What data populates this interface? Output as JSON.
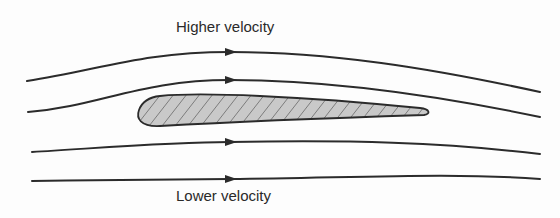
{
  "diagram": {
    "labels": {
      "top": "Higher velocity",
      "bottom": "Lower velocity"
    },
    "colors": {
      "stroke": "#2b2b2b",
      "airfoil_fill": "#c9c9c9",
      "hatch": "#3a3a3a",
      "background": "#fdfdfd"
    },
    "streamlines": [
      {
        "id": "streamline-1",
        "path": "M27,81 C100,70 140,52 230,52 C330,52 430,68 540,92",
        "arrow_at": [
          230,
          52
        ]
      },
      {
        "id": "streamline-2",
        "path": "M28,112 C100,106 140,80 230,80 C320,80 430,94 540,117",
        "arrow_at": [
          230,
          80
        ]
      },
      {
        "id": "streamline-3",
        "path": "M32,152 C100,148 170,142 230,142 C350,140 440,142 540,154",
        "arrow_at": [
          230,
          142
        ]
      },
      {
        "id": "streamline-4",
        "path": "M32,181 C100,180 170,179 230,179 C350,178 450,172 540,179",
        "arrow_at": [
          230,
          179
        ]
      }
    ],
    "airfoil": {
      "path": "M160,96 C200,92 300,96 420,108 C430,109 431,114 424,115 C330,118 230,122 160,126 C140,127 136,118 139,110 C142,102 150,97 160,96 Z"
    }
  }
}
